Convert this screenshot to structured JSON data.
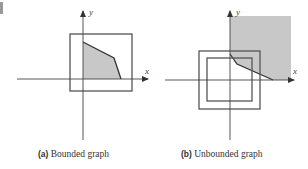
{
  "figure": {
    "panels": [
      {
        "id": "a",
        "tag": "(a)",
        "caption": "Bounded graph",
        "x_axis_label": "x",
        "y_axis_label": "y",
        "region": "bounded",
        "boxes": 1
      },
      {
        "id": "b",
        "tag": "(b)",
        "caption": "Unbounded graph",
        "x_axis_label": "x",
        "y_axis_label": "y",
        "region": "unbounded",
        "boxes": 2
      }
    ],
    "colors": {
      "axis": "#444444",
      "box": "#555555",
      "fill": "#c8c8c8",
      "boundary": "#333333"
    }
  }
}
